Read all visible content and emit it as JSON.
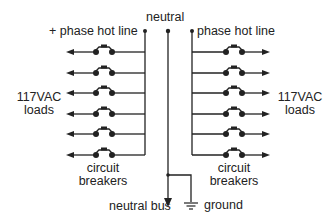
{
  "diagram": {
    "labels": {
      "neutral": "neutral",
      "left_hot": "+ phase hot line",
      "right_hot": "phase hot line",
      "left_loads_1": "117VAC",
      "left_loads_2": "loads",
      "right_loads_1": "117VAC",
      "right_loads_2": "loads",
      "left_breakers_1": "circuit",
      "left_breakers_2": "breakers",
      "right_breakers_1": "circuit",
      "right_breakers_2": "breakers",
      "neutral_bus": "neutral bus",
      "ground": "ground"
    },
    "breaker_rows_per_side": 6,
    "line_color": "#222222"
  }
}
